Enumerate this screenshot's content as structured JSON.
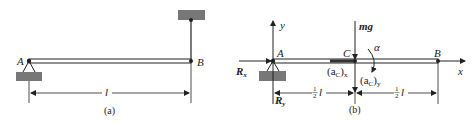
{
  "figure_a": {
    "caption": "(a)",
    "point_a": "A",
    "point_b": "B",
    "length": "l"
  },
  "figure_b": {
    "caption": "(b)",
    "point_a": "A",
    "point_b": "B",
    "point_c": "C",
    "axis_x": "x",
    "axis_y": "y",
    "weight": "mg",
    "angular_acc": "α",
    "reaction_x": "R",
    "reaction_x_sub": "x",
    "reaction_y": "R",
    "reaction_y_sub": "y",
    "acc_cx": "(a",
    "acc_cx_sub_c": "C",
    "acc_cx_close": ")",
    "acc_cx_sub": "x",
    "acc_cy": "(a",
    "acc_cy_sub_c": "C",
    "acc_cy_close": ")",
    "acc_cy_sub": "y",
    "half_num": "1",
    "half_den": "2",
    "half_l": "l"
  },
  "colors": {
    "ink": "#222222",
    "ground": "#777777",
    "beam_fill": "#ffffff"
  }
}
